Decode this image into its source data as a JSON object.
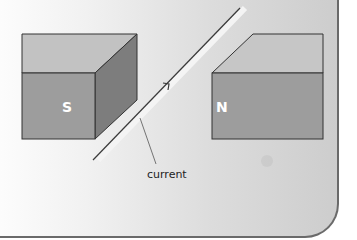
{
  "diagram": {
    "type": "magnetic field with current-carrying wire",
    "magnets": [
      {
        "id": "south",
        "label": "S",
        "pole": "south"
      },
      {
        "id": "north",
        "label": "N",
        "pole": "north"
      }
    ],
    "wire": {
      "label": "current",
      "direction": "up-right"
    },
    "colors": {
      "magnet_front": "#9d9d9d",
      "magnet_top": "#c2c2c2",
      "magnet_side": "#7d7d7d",
      "outline": "#333333",
      "wire": "#3a3a3a",
      "label_text": "#ffffff",
      "callout_text": "#222222"
    }
  }
}
